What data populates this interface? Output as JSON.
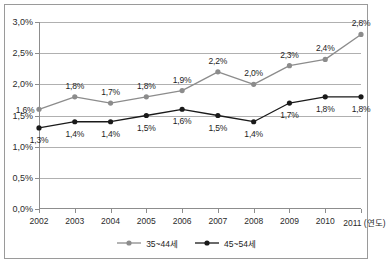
{
  "chart_data": {
    "type": "line",
    "title": "",
    "xlabel": "(연도)",
    "ylabel": "",
    "categories": [
      "2002",
      "2003",
      "2004",
      "2005",
      "2006",
      "2007",
      "2008",
      "2009",
      "2010",
      "2011"
    ],
    "ylim": [
      0.0,
      3.0
    ],
    "ytick_labels": [
      "0,0%",
      "0,5%",
      "1,0%",
      "1,5%",
      "2,0%",
      "2,5%",
      "3,0%"
    ],
    "ytick_values": [
      0.0,
      0.5,
      1.0,
      1.5,
      2.0,
      2.5,
      3.0
    ],
    "grid": true,
    "legend_position": "bottom",
    "series": [
      {
        "name": "35~44세",
        "color": "#8c8c8c",
        "marker": "circle",
        "values": [
          1.6,
          1.8,
          1.7,
          1.8,
          1.9,
          2.2,
          2.0,
          2.3,
          2.4,
          2.8
        ],
        "labels": [
          "1,6%",
          "1,8%",
          "1,7%",
          "1,8%",
          "1,9%",
          "2,2%",
          "2,0%",
          "2,3%",
          "2,4%",
          "2,8%"
        ],
        "label_positions": [
          "below-left",
          "above",
          "above",
          "above",
          "above",
          "above",
          "above",
          "above",
          "above",
          "above"
        ]
      },
      {
        "name": "45~54세",
        "color": "#1a1a1a",
        "marker": "circle",
        "values": [
          1.3,
          1.4,
          1.4,
          1.5,
          1.6,
          1.5,
          1.4,
          1.7,
          1.8,
          1.8
        ],
        "labels": [
          "1,3%",
          "1,4%",
          "1,4%",
          "1,5%",
          "1,6%",
          "1,5%",
          "1,4%",
          "1,7%",
          "1,8%",
          "1,8%"
        ],
        "label_positions": [
          "below",
          "below",
          "below",
          "below",
          "below",
          "below",
          "below",
          "below",
          "below",
          "below"
        ]
      }
    ]
  },
  "xaxis_unit_label": "(연도)",
  "frame": {
    "border_color": "#9a9a9a",
    "background": "#ffffff"
  }
}
